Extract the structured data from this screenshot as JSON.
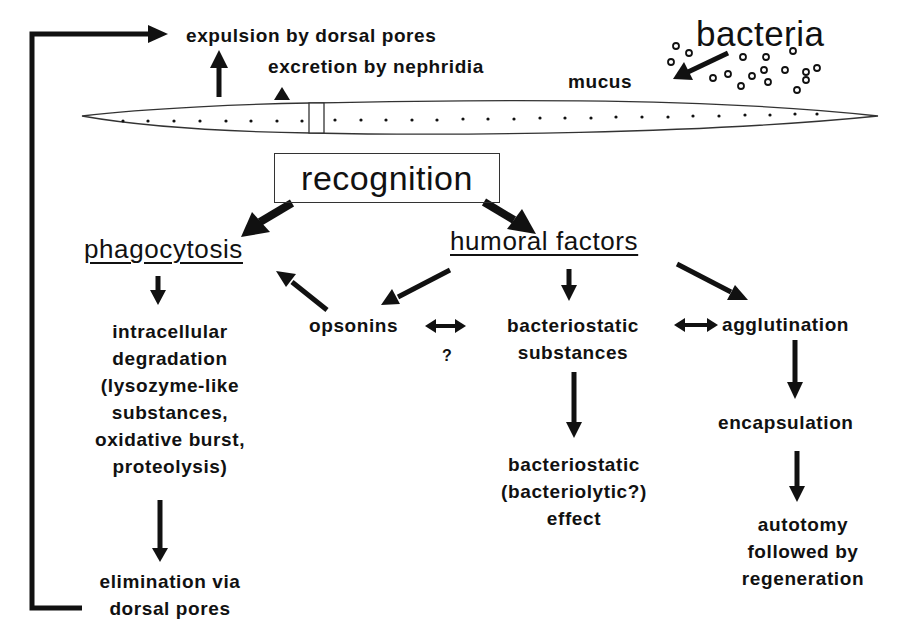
{
  "diagram": {
    "type": "flowchart",
    "top": {
      "expulsion": "expulsion by dorsal pores",
      "excretion": "excretion by nephridia",
      "mucus": "mucus",
      "bacteria": "bacteria"
    },
    "worm_body": {
      "segment_pore_count": 36
    },
    "center": {
      "recognition": "recognition"
    },
    "branches": {
      "phagocytosis": "phagocytosis",
      "humoral": "humoral factors"
    },
    "phagocytosis_chain": {
      "degradation": [
        "intracellular",
        "degradation",
        "(lysozyme-like",
        "substances,",
        "oxidative burst,",
        "proteolysis)"
      ],
      "elimination": [
        "elimination via",
        "dorsal pores"
      ]
    },
    "humoral_chain": {
      "opsonins": "opsonins",
      "question": "?",
      "bacteriostatic_substances": [
        "bacteriostatic",
        "substances"
      ],
      "agglutination": "agglutination",
      "bacteriostatic_effect": [
        "bacteriostatic",
        "(bacteriolytic?)",
        "effect"
      ],
      "encapsulation": "encapsulation",
      "autotomy": [
        "autotomy",
        "followed by",
        "regeneration"
      ]
    },
    "edges": [
      {
        "from": "recognition",
        "to": "phagocytosis"
      },
      {
        "from": "recognition",
        "to": "humoral factors"
      },
      {
        "from": "phagocytosis",
        "to": "intracellular degradation"
      },
      {
        "from": "intracellular degradation",
        "to": "elimination via dorsal pores"
      },
      {
        "from": "elimination via dorsal pores",
        "to": "expulsion by dorsal pores"
      },
      {
        "from": "humoral factors",
        "to": "opsonins"
      },
      {
        "from": "humoral factors",
        "to": "bacteriostatic substances"
      },
      {
        "from": "humoral factors",
        "to": "agglutination"
      },
      {
        "from": "opsonins",
        "to": "phagocytosis"
      },
      {
        "from": "opsonins",
        "to": "bacteriostatic substances",
        "bidirectional": true,
        "label": "?"
      },
      {
        "from": "bacteriostatic substances",
        "to": "agglutination",
        "bidirectional": true
      },
      {
        "from": "bacteriostatic substances",
        "to": "bacteriostatic (bacteriolytic?) effect"
      },
      {
        "from": "agglutination",
        "to": "encapsulation"
      },
      {
        "from": "encapsulation",
        "to": "autotomy followed by regeneration"
      },
      {
        "from": "bacteria",
        "to": "mucus"
      }
    ]
  }
}
